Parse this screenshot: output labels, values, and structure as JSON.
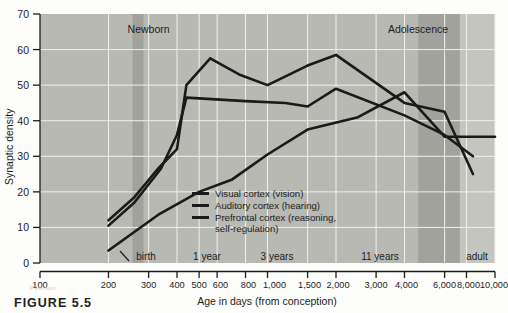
{
  "figure": {
    "caption": "FIGURE 5.5",
    "watermark": "Pearson"
  },
  "chart_data": {
    "type": "line",
    "title": "",
    "xlabel": "Age in days (from conception)",
    "ylabel": "Synaptic density",
    "xscale": "log",
    "xlim": [
      100,
      10000
    ],
    "ylim": [
      0,
      70
    ],
    "grid": true,
    "legend_position": "center",
    "x_tick_labels": [
      "100",
      "200",
      "300",
      "400",
      "500",
      "600",
      "800",
      "1,000",
      "1,500",
      "2,000",
      "3,000",
      "4,000",
      "6,000",
      "8,000",
      "10,000"
    ],
    "x_tick_values": [
      100,
      200,
      300,
      400,
      500,
      600,
      800,
      1000,
      1500,
      2000,
      3000,
      4000,
      6000,
      8000,
      10000
    ],
    "y_tick_labels": [
      "0",
      "10",
      "20",
      "30",
      "40",
      "50",
      "60",
      "70"
    ],
    "y_tick_values": [
      0,
      10,
      20,
      30,
      40,
      50,
      60,
      70
    ],
    "band_labels": [
      "Newborn",
      "Adolescence"
    ],
    "bands": [
      {
        "label": "Newborn",
        "x_start": 255,
        "x_end": 285,
        "color": "#9d9d99"
      },
      {
        "label": "Adolescence",
        "x_start": 4600,
        "x_end": 7000,
        "color": "#9d9d99"
      }
    ],
    "inner_annotations": [
      {
        "label": "birth",
        "x": 270
      },
      {
        "label": "1 year",
        "x": 640
      },
      {
        "label": "3 years",
        "x": 1380
      },
      {
        "label": "11 years",
        "x": 4200
      },
      {
        "label": "adult",
        "x": 9200
      }
    ],
    "series": [
      {
        "name": "Visual cortex (vision)",
        "legend_label": "Visual cortex (vision)",
        "color": "#1a1a1a",
        "x": [
          200,
          260,
          330,
          400,
          440,
          560,
          750,
          1000,
          1500,
          2000,
          4000,
          6000,
          8000
        ],
        "y": [
          12,
          18.5,
          26.5,
          32,
          50,
          57.5,
          53,
          50,
          55.5,
          58.5,
          45,
          42.5,
          25
        ]
      },
      {
        "name": "Auditory cortex (hearing)",
        "legend_label": "Auditory cortex (hearing)",
        "color": "#1a1a1a",
        "x": [
          200,
          260,
          340,
          400,
          440,
          800,
          1200,
          1500,
          2000,
          4000,
          6000,
          8000
        ],
        "y": [
          10.5,
          17,
          26.5,
          36,
          46.5,
          45.5,
          45,
          44,
          49,
          41.5,
          36,
          30
        ]
      },
      {
        "name": "Prefrontal cortex (reasoning, self-regulation)",
        "legend_label": "Prefrontal cortex (reasoning,",
        "legend_label_2": "self-regulation)",
        "color": "#1a1a1a",
        "x": [
          200,
          330,
          500,
          700,
          1000,
          1500,
          2500,
          4000,
          6000,
          10000
        ],
        "y": [
          3.5,
          13.5,
          20,
          23.5,
          30.5,
          37.5,
          41,
          48,
          35.5,
          35.5
        ]
      }
    ]
  }
}
